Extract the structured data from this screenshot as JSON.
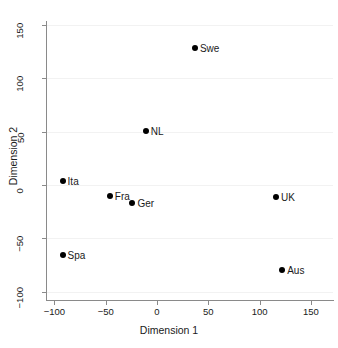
{
  "chart_data": {
    "type": "scatter",
    "title": "",
    "xlabel": "Dimension 1",
    "ylabel": "Dimension 2",
    "xlim": [
      -115,
      165
    ],
    "ylim": [
      -110,
      160
    ],
    "xticks": [
      -100,
      -50,
      0,
      50,
      100,
      150
    ],
    "xtick_labels": [
      "−100",
      "−50",
      "0",
      "50",
      "100",
      "150"
    ],
    "yticks": [
      -100,
      -50,
      0,
      50,
      100,
      150
    ],
    "ytick_labels": [
      "−100",
      "−50",
      "0",
      "50",
      "100",
      "150"
    ],
    "grid": true,
    "grid_orientation": "horizontal",
    "legend": "none",
    "marker": "filled-circle",
    "marker_color": "#000000",
    "points": [
      {
        "label": "Swe",
        "x": 37,
        "y": 128,
        "label_pos": "right"
      },
      {
        "label": "NL",
        "x": -11,
        "y": 51,
        "label_pos": "right"
      },
      {
        "label": "Ita",
        "x": -92,
        "y": 4,
        "label_pos": "right"
      },
      {
        "label": "Fra",
        "x": -46,
        "y": -10,
        "label_pos": "right"
      },
      {
        "label": "Ger",
        "x": -24,
        "y": -17,
        "label_pos": "right"
      },
      {
        "label": "UK",
        "x": 116,
        "y": -11,
        "label_pos": "right"
      },
      {
        "label": "Spa",
        "x": -92,
        "y": -66,
        "label_pos": "right"
      },
      {
        "label": "Aus",
        "x": 122,
        "y": -80,
        "label_pos": "right"
      }
    ]
  }
}
